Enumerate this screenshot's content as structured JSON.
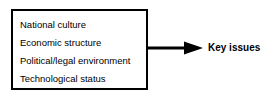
{
  "diagram": {
    "factors_box": {
      "items": [
        {
          "label": "National culture"
        },
        {
          "label": "Economic structure"
        },
        {
          "label": "Political/legal environment"
        },
        {
          "label": "Technological status"
        }
      ]
    },
    "connector": {
      "icon": "arrow-right-icon",
      "direction": "right"
    },
    "outcome": {
      "label": "Key issues"
    },
    "colors": {
      "background": "#ffffff",
      "stroke": "#000000",
      "text": "#000000"
    }
  }
}
